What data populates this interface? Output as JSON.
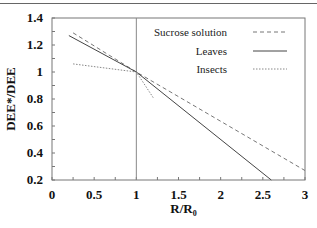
{
  "chart_data": {
    "type": "line",
    "title": "",
    "xlabel": "R/R₀",
    "ylabel": "DEE*/DEE",
    "xlim": [
      0,
      3
    ],
    "ylim": [
      0.2,
      1.4
    ],
    "xticks": [
      "0",
      "0.5",
      "1",
      "1.5",
      "2",
      "2.5",
      "3"
    ],
    "yticks": [
      "0.2",
      "0.4",
      "0.6",
      "0.8",
      "1",
      "1.2",
      "1.4"
    ],
    "grid": false,
    "reference_line": {
      "x": 1
    },
    "legend_position": "upper right inside",
    "series": [
      {
        "name": "Sucrose solution",
        "style": "dashed",
        "x": [
          0.25,
          1,
          3
        ],
        "y": [
          1.29,
          1.0,
          0.27
        ]
      },
      {
        "name": "Leaves",
        "style": "solid",
        "x": [
          0.2,
          1,
          2.6
        ],
        "y": [
          1.27,
          1.0,
          0.2
        ]
      },
      {
        "name": "Insects",
        "style": "dotted",
        "x": [
          0.25,
          1,
          1.2
        ],
        "y": [
          1.06,
          1.0,
          0.81
        ]
      }
    ]
  }
}
